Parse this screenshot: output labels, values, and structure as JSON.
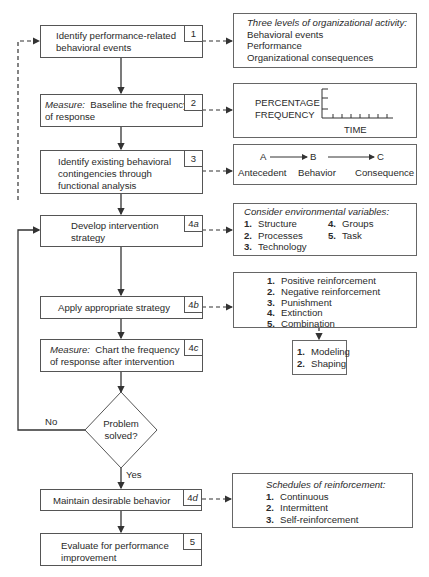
{
  "flow": {
    "step1": {
      "num": "1",
      "line1": "Identify performance-related",
      "line2": "behavioral events"
    },
    "step2": {
      "num": "2",
      "prefix": "Measure:",
      "line1": "Baseline the frequency",
      "line2": "of response"
    },
    "step3": {
      "num": "3",
      "line1": "Identify existing behavioral",
      "line2": "contingencies through",
      "line3": "functional analysis"
    },
    "step4a": {
      "num": "4",
      "suffix": "a",
      "line1": "Develop intervention",
      "line2": "strategy"
    },
    "step4b": {
      "num": "4",
      "suffix": "b",
      "line1": "Apply appropriate strategy"
    },
    "step4c": {
      "num": "4",
      "suffix": "c",
      "prefix": "Measure:",
      "line1": "Chart the frequency",
      "line2": "of response after intervention"
    },
    "decision": {
      "line1": "Problem",
      "line2": "solved?",
      "no_label": "No",
      "yes_label": "Yes"
    },
    "step4d": {
      "num": "4",
      "suffix": "d",
      "line1": "Maintain desirable behavior"
    },
    "step5": {
      "num": "5",
      "line1": "Evaluate for performance",
      "line2": "improvement"
    }
  },
  "notes": {
    "levels": {
      "title": "Three levels of organizational activity:",
      "items": [
        "Behavioral events",
        "Performance",
        "Organizational consequences"
      ]
    },
    "graph": {
      "ylabel1": "PERCENTAGE",
      "ylabel2": "FREQUENCY",
      "xlabel": "TIME"
    },
    "abc": {
      "a": "A",
      "b": "B",
      "c": "C",
      "a_label": "Antecedent",
      "b_label": "Behavior",
      "c_label": "Consequence"
    },
    "environment": {
      "title": "Consider environmental variables:",
      "items": [
        {
          "n": "1.",
          "label": "Structure"
        },
        {
          "n": "2.",
          "label": "Processes"
        },
        {
          "n": "3.",
          "label": "Technology"
        },
        {
          "n": "4.",
          "label": "Groups"
        },
        {
          "n": "5.",
          "label": "Task"
        }
      ]
    },
    "strategies": {
      "items": [
        {
          "n": "1.",
          "label": "Positive reinforcement"
        },
        {
          "n": "2.",
          "label": "Negative reinforcement"
        },
        {
          "n": "3.",
          "label": "Punishment"
        },
        {
          "n": "4.",
          "label": "Extinction"
        },
        {
          "n": "5.",
          "label": "Combination"
        }
      ]
    },
    "modeling": {
      "items": [
        {
          "n": "1.",
          "label": "Modeling"
        },
        {
          "n": "2.",
          "label": "Shaping"
        }
      ]
    },
    "schedules": {
      "title": "Schedules of reinforcement:",
      "items": [
        {
          "n": "1.",
          "label": "Continuous"
        },
        {
          "n": "2.",
          "label": "Intermittent"
        },
        {
          "n": "3.",
          "label": "Self-reinforcement"
        }
      ]
    }
  }
}
